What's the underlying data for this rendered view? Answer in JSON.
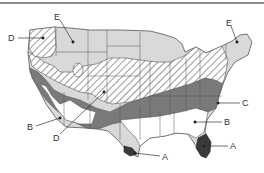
{
  "map": {
    "subject": "United States climate/vegetation zones",
    "colors": {
      "zone_A": "#3a3a3a",
      "zone_B": "#ffffff",
      "zone_C": "#7a7a7a",
      "zone_D": "hatched",
      "zone_E": "#d9d9d9",
      "border": "#555555",
      "top_rule": "#8a8a8a"
    },
    "labels": [
      {
        "id": "E-northwest",
        "text": "E"
      },
      {
        "id": "D-northwest",
        "text": "D"
      },
      {
        "id": "E-northeast",
        "text": "E"
      },
      {
        "id": "C-east",
        "text": "C"
      },
      {
        "id": "B-southeast",
        "text": "B"
      },
      {
        "id": "A-florida",
        "text": "A"
      },
      {
        "id": "A-texas",
        "text": "A"
      },
      {
        "id": "B-california",
        "text": "B"
      },
      {
        "id": "D-southwest",
        "text": "D"
      }
    ]
  }
}
